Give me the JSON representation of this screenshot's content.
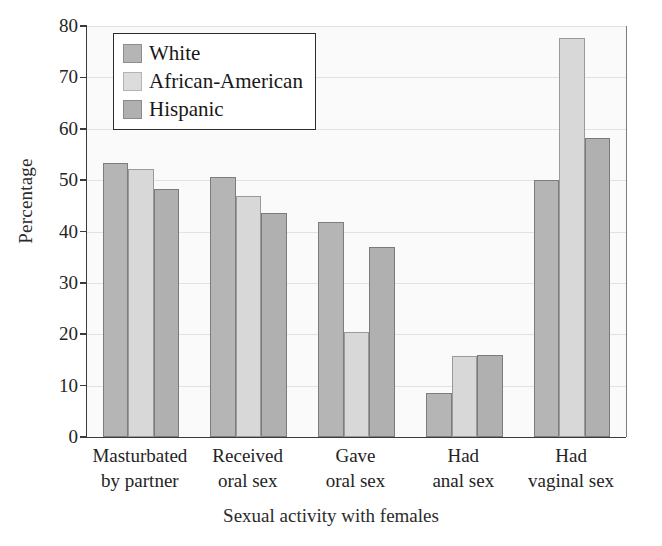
{
  "chart_data": {
    "type": "bar",
    "title": "",
    "xlabel": "Sexual activity with females",
    "ylabel": "Percentage",
    "ylim": [
      0,
      80
    ],
    "ytick_step": 10,
    "yticks": [
      0,
      10,
      20,
      30,
      40,
      50,
      60,
      70,
      80
    ],
    "grid": true,
    "legend_position": "top-left-inside",
    "categories": [
      "Masturbated by partner",
      "Received oral sex",
      "Gave oral sex",
      "Had anal sex",
      "Had vaginal sex"
    ],
    "category_lines": [
      [
        "Masturbated",
        "by partner"
      ],
      [
        "Received",
        "oral sex"
      ],
      [
        "Gave",
        "oral sex"
      ],
      [
        "Had",
        "anal sex"
      ],
      [
        "Had",
        "vaginal sex"
      ]
    ],
    "series": [
      {
        "name": "White",
        "color": "#b5b5b5",
        "values": [
          53.4,
          50.6,
          41.8,
          8.5,
          50.1
        ]
      },
      {
        "name": "African-American",
        "color": "#dcdcdc",
        "values": [
          52.1,
          47.0,
          20.4,
          15.7,
          77.6
        ]
      },
      {
        "name": "Hispanic",
        "color": "#b0b0b0",
        "values": [
          48.2,
          43.6,
          36.9,
          15.9,
          58.2
        ]
      }
    ]
  },
  "legend": {
    "items": [
      {
        "label": "White"
      },
      {
        "label": "African-American"
      },
      {
        "label": "Hispanic"
      }
    ]
  }
}
